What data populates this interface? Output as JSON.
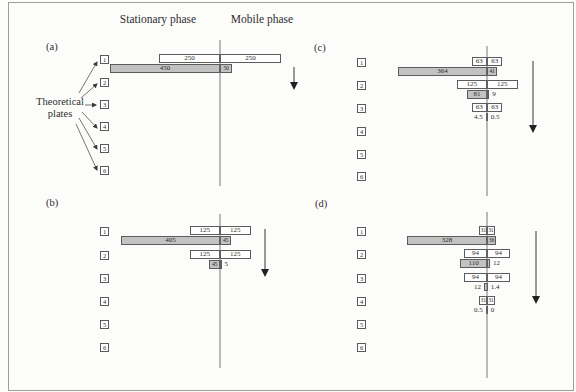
{
  "figure": {
    "headers": {
      "stationary": "Stationary phase",
      "mobile": "Mobile phase"
    },
    "theoretical_plates": {
      "line1": "Theoretical",
      "line2": "plates"
    },
    "plate_numbers": [
      "1",
      "2",
      "3",
      "4",
      "5",
      "6"
    ],
    "panels": [
      {
        "label": "(a)",
        "rows": [
          {
            "plate": 1,
            "bars": [
              {
                "style": "white",
                "mode": "inside",
                "left": 250,
                "right": 250,
                "left_label": "250",
                "right_label": "250"
              },
              {
                "style": "gray",
                "mode": "inside",
                "left": 450,
                "right": 50,
                "left_label": "450",
                "right_label": "50"
              }
            ]
          }
        ]
      },
      {
        "label": "(b)",
        "rows": [
          {
            "plate": 1,
            "bars": [
              {
                "style": "white",
                "mode": "inside",
                "left": 125,
                "right": 125,
                "left_label": "125",
                "right_label": "125"
              },
              {
                "style": "gray",
                "mode": "inside",
                "left": 405,
                "right": 45,
                "left_label": "405",
                "right_label": "45"
              }
            ]
          },
          {
            "plate": 2,
            "bars": [
              {
                "style": "white",
                "mode": "inside",
                "left": 125,
                "right": 125,
                "left_label": "125",
                "right_label": "125"
              },
              {
                "style": "gray",
                "mode": "right-outside",
                "left": 45,
                "right": 5,
                "left_label": "45",
                "right_label": "5"
              }
            ]
          }
        ]
      },
      {
        "label": "(c)",
        "rows": [
          {
            "plate": 1,
            "bars": [
              {
                "style": "white",
                "mode": "inside",
                "left": 63,
                "right": 63,
                "left_label": "63",
                "right_label": "63"
              },
              {
                "style": "gray",
                "mode": "inside",
                "left": 364,
                "right": 41,
                "left_label": "364",
                "right_label": "41"
              }
            ]
          },
          {
            "plate": 2,
            "bars": [
              {
                "style": "white",
                "mode": "inside",
                "left": 125,
                "right": 125,
                "left_label": "125",
                "right_label": "125"
              },
              {
                "style": "gray",
                "mode": "right-outside",
                "left": 81,
                "right": 9,
                "left_label": "81",
                "right_label": "9"
              }
            ]
          },
          {
            "plate": 3,
            "bars": [
              {
                "style": "white",
                "mode": "inside",
                "left": 63,
                "right": 63,
                "left_label": "63",
                "right_label": "63"
              },
              {
                "style": "gray",
                "mode": "outside",
                "left": 4.5,
                "right": 0.5,
                "left_label": "4.5",
                "right_label": "0.5"
              }
            ]
          }
        ]
      },
      {
        "label": "(d)",
        "rows": [
          {
            "plate": 1,
            "bars": [
              {
                "style": "white",
                "mode": "inside",
                "left": 31,
                "right": 31,
                "left_label": "31",
                "right_label": "31"
              },
              {
                "style": "gray",
                "mode": "inside",
                "left": 328,
                "right": 36,
                "left_label": "328",
                "right_label": "36"
              }
            ]
          },
          {
            "plate": 2,
            "bars": [
              {
                "style": "white",
                "mode": "inside",
                "left": 94,
                "right": 94,
                "left_label": "94",
                "right_label": "94"
              },
              {
                "style": "gray",
                "mode": "right-outside",
                "left": 110,
                "right": 12,
                "left_label": "110",
                "right_label": "12"
              }
            ]
          },
          {
            "plate": 3,
            "bars": [
              {
                "style": "white",
                "mode": "inside",
                "left": 94,
                "right": 94,
                "left_label": "94",
                "right_label": "94"
              },
              {
                "style": "gray",
                "mode": "outside",
                "left": 12,
                "right": 1.4,
                "left_label": "12",
                "right_label": "1.4"
              }
            ]
          },
          {
            "plate": 4,
            "bars": [
              {
                "style": "white",
                "mode": "inside",
                "left": 31,
                "right": 31,
                "left_label": "31",
                "right_label": "31"
              },
              {
                "style": "gray",
                "mode": "outside",
                "left": 0.5,
                "right": 0,
                "left_label": "0.5",
                "right_label": "0"
              }
            ]
          }
        ]
      }
    ]
  }
}
